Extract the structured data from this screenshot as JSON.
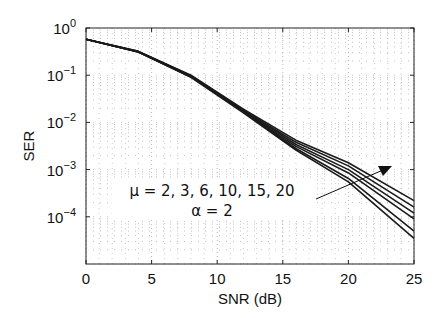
{
  "chart_data": {
    "type": "line",
    "title": "",
    "xlabel": "SNR (dB)",
    "ylabel": "SER",
    "xlim": [
      0,
      25
    ],
    "ylim": [
      1e-05,
      1
    ],
    "yscale": "log",
    "grid": true,
    "x_ticks": [
      "0",
      "5",
      "10",
      "15",
      "20",
      "25"
    ],
    "y_ticks": [
      {
        "base": "10",
        "exp": "0"
      },
      {
        "base": "10",
        "exp": "−1"
      },
      {
        "base": "10",
        "exp": "−2"
      },
      {
        "base": "10",
        "exp": "−3"
      },
      {
        "base": "10",
        "exp": "−4"
      }
    ],
    "x": [
      0,
      4,
      8,
      12,
      16,
      20,
      25
    ],
    "series": [
      {
        "name": "μ = 2",
        "values": [
          0.58,
          0.32,
          0.1,
          0.019,
          0.0042,
          0.0014,
          0.00022
        ]
      },
      {
        "name": "μ = 3",
        "values": [
          0.58,
          0.32,
          0.098,
          0.018,
          0.0038,
          0.0012,
          0.00016
        ]
      },
      {
        "name": "μ = 6",
        "values": [
          0.58,
          0.31,
          0.095,
          0.018,
          0.0034,
          0.001,
          0.00012
        ]
      },
      {
        "name": "μ = 10",
        "values": [
          0.58,
          0.31,
          0.093,
          0.017,
          0.0031,
          0.00085,
          9e-05
        ]
      },
      {
        "name": "μ = 15",
        "values": [
          0.58,
          0.31,
          0.092,
          0.017,
          0.0028,
          0.00065,
          5e-05
        ]
      },
      {
        "name": "μ = 20",
        "values": [
          0.58,
          0.31,
          0.09,
          0.016,
          0.0026,
          0.00055,
          3.5e-05
        ]
      }
    ],
    "annotations": [
      {
        "text": "μ = 2, 3, 6, 10, 15, 20",
        "type": "text"
      },
      {
        "text": "α = 2",
        "type": "text"
      },
      {
        "type": "arrow",
        "direction": "increasing μ"
      }
    ],
    "legend": "none"
  }
}
